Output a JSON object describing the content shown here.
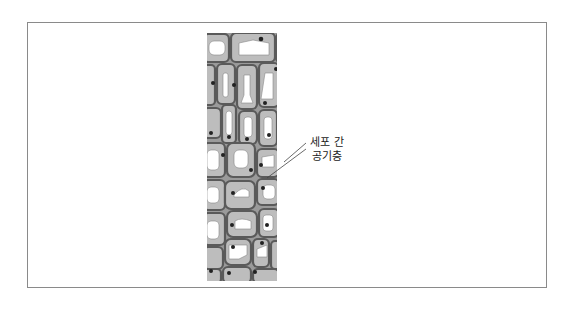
{
  "diagram": {
    "label": {
      "line1": "세포 간",
      "line2": "공기층"
    },
    "colors": {
      "frame_border": "#8a8a8a",
      "cell_wall": "#5a5a5a",
      "cytoplasm": "#bdbdbd",
      "vacuole": "#ffffff",
      "nucleus": "#2a2a2a",
      "label_text": "#222222"
    }
  }
}
